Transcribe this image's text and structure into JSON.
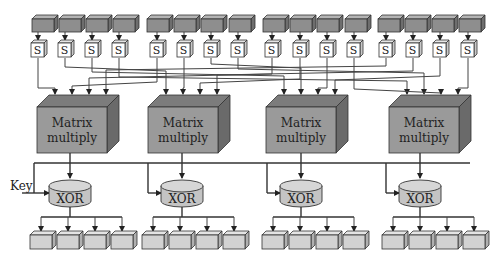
{
  "diagram": {
    "title": "",
    "colors": {
      "input_block_front": "#8e8e8e",
      "input_block_top": "#b4b4b4",
      "input_block_side": "#6e6e6e",
      "sbox_front": "#ffffff",
      "sbox_side": "#c8c8c8",
      "matrix_front": "#9a9a9a",
      "matrix_top": "#7c7c7c",
      "matrix_side": "#6a6a6a",
      "xor_fill": "#c4c4c4",
      "output_front": "#d2d2d2",
      "output_top": "#e4e4e4",
      "output_side": "#b0b0b0",
      "line": "#333333"
    },
    "sbox_label": "S",
    "matrix_label_line1": "Matrix",
    "matrix_label_line2": "multiply",
    "xor_label": "XOR",
    "key_label": "Key",
    "input_block_x": [
      32,
      59,
      86,
      113,
      147,
      174,
      201,
      229,
      263,
      290,
      317,
      345,
      378,
      405,
      432,
      459
    ],
    "sbox_center_x": [
      38,
      65,
      92,
      119,
      157,
      184,
      211,
      238,
      272,
      300,
      327,
      354,
      386,
      413,
      440,
      468
    ],
    "matrices": [
      {
        "x": 37,
        "label1": "Matrix",
        "label2": "multiply"
      },
      {
        "x": 148,
        "label1": "Matrix",
        "label2": "multiply"
      },
      {
        "x": 266,
        "label1": "Matrix",
        "label2": "multiply"
      },
      {
        "x": 389,
        "label1": "Matrix",
        "label2": "multiply"
      }
    ],
    "xor_center_x": [
      70,
      182,
      301,
      420
    ],
    "output_groups_x": [
      [
        30,
        57,
        84,
        111
      ],
      [
        142,
        169,
        196,
        223
      ],
      [
        262,
        289,
        316,
        343
      ],
      [
        382,
        409,
        436,
        463
      ]
    ]
  }
}
